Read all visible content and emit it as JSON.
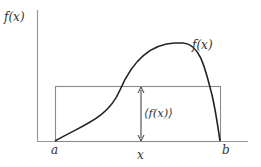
{
  "diagram": {
    "y_axis_label": "f(x)",
    "x_axis_label": "x",
    "curve_label": "f(x)",
    "mean_label": "⟨f(x)⟩",
    "left_bound_label": "a",
    "right_bound_label": "b",
    "colors": {
      "axis": "#9a9a9a",
      "rectangle": "#8a8a8a",
      "curve": "#222222",
      "text": "#333333"
    }
  }
}
